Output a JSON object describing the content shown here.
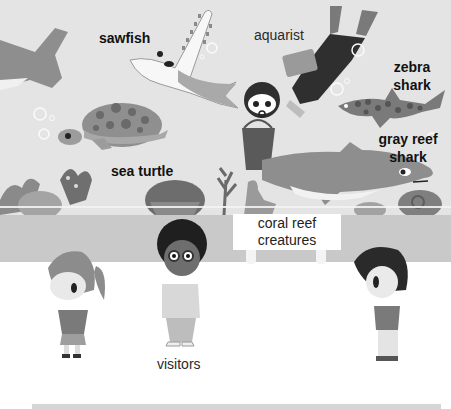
{
  "title": "coral reef creatures",
  "labels": {
    "sawfish": "sawfish",
    "aquarist": "aquarist",
    "zebra_shark_line1": "zebra",
    "zebra_shark_line2": "shark",
    "gray_reef_shark_line1": "gray reef",
    "gray_reef_shark_line2": "shark",
    "sea_turtle": "sea turtle",
    "visitors": "visitors"
  },
  "sign": {
    "line1": "coral reef",
    "line2": "creatures"
  },
  "colors": {
    "tank_bg": "#e4e4e4",
    "wall": "#c9c9c9",
    "floor": "#ffffff",
    "shark_gray": "#8a8a8a",
    "dark": "#333333"
  }
}
